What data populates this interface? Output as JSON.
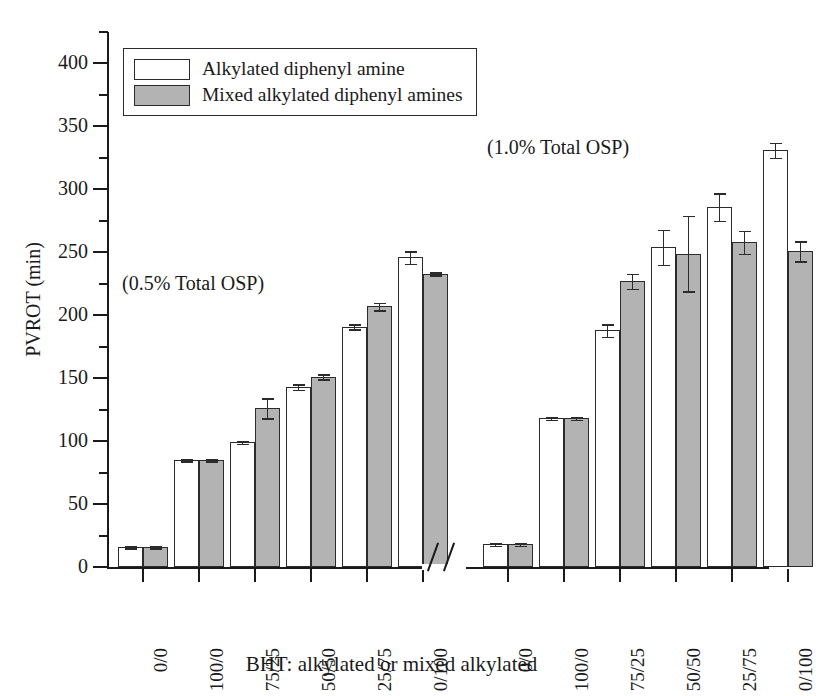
{
  "figure": {
    "background_color": "#ffffff",
    "line_color": "#1a1a1a"
  },
  "axes": {
    "y_title": "PVROT (min)",
    "x_title": "BHT: alkylated or mixed alkylated",
    "y_ticks": [
      "0",
      "50",
      "100",
      "150",
      "200",
      "250",
      "300",
      "350",
      "400"
    ],
    "y_min": 0,
    "y_max": 425,
    "y_major_step": 50,
    "y_minor_step": 25
  },
  "legend": {
    "entries": [
      {
        "label": "Alkylated diphenyl amine",
        "color": "#ffffff",
        "swatch": "white-swatch"
      },
      {
        "label": "Mixed alkylated diphenyl amines",
        "color": "#b3b3b3",
        "swatch": "gray-swatch"
      }
    ]
  },
  "annotations": {
    "left": "(0.5% Total OSP)",
    "right": "(1.0% Total OSP)",
    "axis_break": "//"
  },
  "chart_data": {
    "type": "bar",
    "title": "",
    "xlabel": "BHT: alkylated or mixed alkylated",
    "ylabel": "PVROT (min)",
    "ylim": [
      0,
      425
    ],
    "grid": false,
    "legend_position": "top-left",
    "axis_break_between_groups": true,
    "groups": [
      {
        "name": "(0.5% Total OSP)",
        "categories": [
          "0/0",
          "100/0",
          "75/25",
          "50/50",
          "25/75",
          "0/100"
        ],
        "series": [
          {
            "name": "Alkylated diphenyl amine",
            "color": "#ffffff",
            "values": [
              16,
              85,
              99,
              143,
              191,
              246
            ],
            "errors": [
              1,
              1,
              1,
              2,
              2,
              5
            ]
          },
          {
            "name": "Mixed alkylated diphenyl amines",
            "color": "#b3b3b3",
            "values": [
              16,
              85,
              126,
              151,
              207,
              233
            ],
            "errors": [
              1,
              1,
              8,
              2,
              3,
              1
            ]
          }
        ]
      },
      {
        "name": "(1.0% Total OSP)",
        "categories": [
          "0/0",
          "100/0",
          "75/25",
          "50/50",
          "25/75",
          "0/100"
        ],
        "series": [
          {
            "name": "Alkylated diphenyl amine",
            "color": "#ffffff",
            "values": [
              18,
              118,
              188,
              254,
              286,
              331
            ],
            "errors": [
              1,
              1,
              5,
              14,
              11,
              6
            ]
          },
          {
            "name": "Mixed alkylated diphenyl amines",
            "color": "#b3b3b3",
            "values": [
              18,
              118,
              227,
              249,
              258,
              251
            ],
            "errors": [
              1,
              1,
              6,
              30,
              9,
              8
            ]
          }
        ]
      }
    ]
  }
}
